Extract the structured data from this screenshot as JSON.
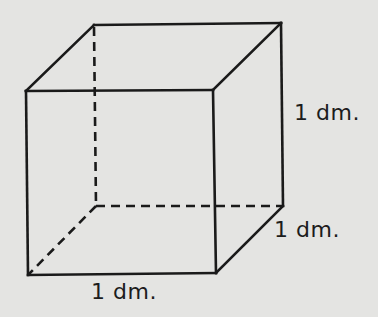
{
  "diagram": {
    "type": "cube-wireframe",
    "line_color": "#1a1a1a",
    "background_color": "#e4e4e2",
    "labels": {
      "height": "1 dm.",
      "depth": "1 dm.",
      "width": "1 dm."
    },
    "vertices": {
      "front_top_left": [
        26,
        91
      ],
      "front_top_right": [
        213,
        90
      ],
      "front_bottom_left": [
        28,
        275
      ],
      "front_bottom_right": [
        216,
        273
      ],
      "back_top_left": [
        94,
        25
      ],
      "back_top_right": [
        281,
        23
      ],
      "back_bottom_left": [
        96,
        206
      ],
      "back_bottom_right": [
        283,
        206
      ]
    },
    "hidden_edges": [
      "back_top_left-back_bottom_left",
      "back_bottom_left-back_bottom_right",
      "back_bottom_left-front_bottom_left"
    ]
  }
}
